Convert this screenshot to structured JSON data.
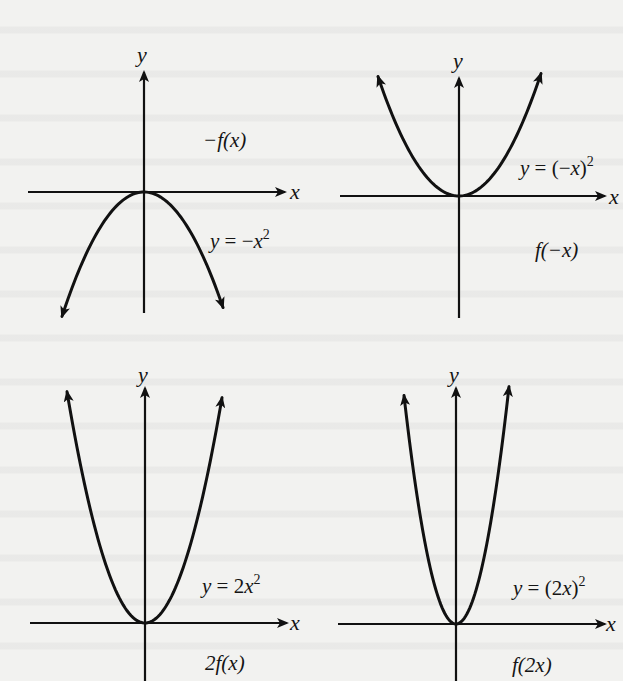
{
  "figure": {
    "panels": [
      {
        "id": "neg-f",
        "transform_label": "−f(x)",
        "equation": {
          "lhs": "y",
          "eq": " = −",
          "var": "x",
          "exp": "2"
        },
        "equation_text": "y = −x²",
        "x_axis_label": "x",
        "y_axis_label": "y",
        "origin": [
          144,
          192
        ],
        "x_axis": [
          28,
          285
        ],
        "y_axis": [
          72,
          313
        ],
        "curve": {
          "a": -0.0185,
          "x_range": [
            -82,
            79
          ],
          "arrows": "down"
        },
        "transform_label_pos": [
          203,
          130
        ],
        "equation_pos": [
          210,
          228
        ],
        "x_label_pos": [
          290,
          181
        ],
        "y_label_pos": [
          137,
          44
        ]
      },
      {
        "id": "f-neg-x",
        "transform_label": "f(−x)",
        "equation": {
          "lhs": "y",
          "eq": " = (−",
          "var": "x",
          "close": ")",
          "exp": "2"
        },
        "equation_text": "y = (−x)²",
        "x_axis_label": "x",
        "y_axis_label": "y",
        "origin": [
          459,
          196
        ],
        "x_axis": [
          340,
          605
        ],
        "y_axis": [
          78,
          318
        ],
        "curve": {
          "a": 0.0182,
          "x_range": [
            -81,
            82
          ],
          "arrows": "up"
        },
        "transform_label_pos": [
          535,
          240
        ],
        "equation_pos": [
          520,
          155
        ],
        "x_label_pos": [
          609,
          186
        ],
        "y_label_pos": [
          453,
          50
        ]
      },
      {
        "id": "two-f",
        "transform_label": "2f(x)",
        "equation": {
          "lhs": "y",
          "eq": " = 2",
          "var": "x",
          "exp": "2"
        },
        "equation_text": "y = 2x²",
        "x_axis_label": "x",
        "y_axis_label": "y",
        "origin": [
          145,
          623
        ],
        "x_axis": [
          30,
          287
        ],
        "y_axis": [
          388,
          681
        ],
        "curve": {
          "a": 0.038,
          "x_range": [
            -78,
            77
          ],
          "arrows": "up"
        },
        "transform_label_pos": [
          205,
          653
        ],
        "equation_pos": [
          202,
          573
        ],
        "x_label_pos": [
          290,
          612
        ],
        "y_label_pos": [
          138,
          364
        ]
      },
      {
        "id": "f-two-x",
        "transform_label": "f(2x)",
        "equation": {
          "lhs": "y",
          "eq": " = (2",
          "var": "x",
          "close": ")",
          "exp": "2"
        },
        "equation_text": "y = (2x)²",
        "x_axis_label": "x",
        "y_axis_label": "y",
        "origin": [
          456,
          624
        ],
        "x_axis": [
          338,
          605
        ],
        "y_axis": [
          388,
          681
        ],
        "curve": {
          "a": 0.0845,
          "x_range": [
            -52,
            53
          ],
          "arrows": "up"
        },
        "transform_label_pos": [
          512,
          655
        ],
        "equation_pos": [
          513,
          575
        ],
        "x_label_pos": [
          606,
          613
        ],
        "y_label_pos": [
          449,
          364
        ]
      }
    ]
  }
}
